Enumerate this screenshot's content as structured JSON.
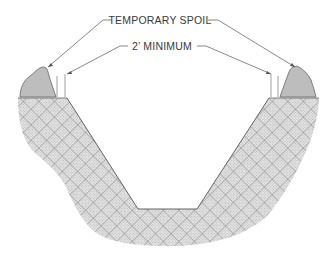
{
  "diagram": {
    "labels": {
      "temporary_spoil": "TEMPORARY SPOIL",
      "minimum_setback": "2’ MINIMUM"
    },
    "elements": [
      {
        "id": "spoil-pile-left",
        "description": "Temporary spoil pile on left bank"
      },
      {
        "id": "spoil-pile-right",
        "description": "Temporary spoil pile on right bank"
      },
      {
        "id": "setback-marker-left",
        "description": "2 ft minimum setback marker, left trench edge"
      },
      {
        "id": "setback-marker-right",
        "description": "2 ft minimum setback marker, right trench edge"
      },
      {
        "id": "trench",
        "description": "Trapezoidal trench with sloped walls and flat bottom"
      },
      {
        "id": "soil-body",
        "description": "Crosshatched native soil surrounding trench"
      }
    ],
    "colors": {
      "soil_hatch": "#9a9a9a",
      "spoil_fill": "#bdbdbd",
      "line": "#555555",
      "background": "#ffffff"
    }
  }
}
